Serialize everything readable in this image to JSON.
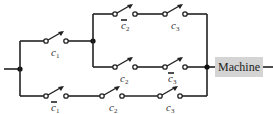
{
  "diagram": {
    "type": "switching-circuit",
    "output_label": "Machine",
    "colors": {
      "wire": "#222222",
      "machine_fill": "#d4d4d4"
    },
    "switches": [
      {
        "id": "s1",
        "var": "c",
        "sub": "1",
        "complement": false
      },
      {
        "id": "s2",
        "var": "c",
        "sub": "2",
        "complement": true
      },
      {
        "id": "s3",
        "var": "c",
        "sub": "3",
        "complement": false
      },
      {
        "id": "s4",
        "var": "c",
        "sub": "2",
        "complement": false
      },
      {
        "id": "s5",
        "var": "c",
        "sub": "3",
        "complement": true
      },
      {
        "id": "s6",
        "var": "c",
        "sub": "1",
        "complement": true
      },
      {
        "id": "s7",
        "var": "c",
        "sub": "2",
        "complement": false
      },
      {
        "id": "s8",
        "var": "c",
        "sub": "3",
        "complement": false
      }
    ],
    "branches": [
      {
        "path": "c1 · (c̄2 · c3 + c2 · c̄3)"
      },
      {
        "path": "c̄1 · c2 · c3"
      }
    ]
  }
}
